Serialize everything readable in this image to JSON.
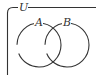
{
  "diagram": {
    "type": "venn",
    "universe_label": "U",
    "sets": [
      {
        "label": "A",
        "cx": 39,
        "cy": 45,
        "r": 22
      },
      {
        "label": "B",
        "cx": 67,
        "cy": 45,
        "r": 22
      }
    ],
    "colors": {
      "stroke": "#333333",
      "background": "#ffffff"
    }
  }
}
